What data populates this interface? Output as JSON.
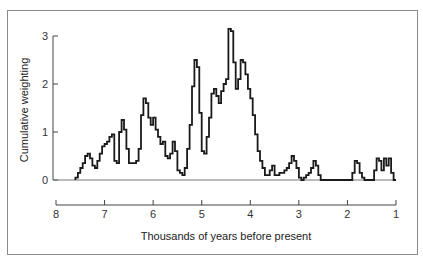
{
  "chart_data": {
    "type": "line",
    "style": "step",
    "title": "",
    "xlabel": "Thousands of years before present",
    "ylabel": "Cumulative weighting",
    "xlim": [
      8,
      1
    ],
    "ylim": [
      0,
      3
    ],
    "x_ticks": [
      "8",
      "7",
      "6",
      "5",
      "4",
      "3",
      "2",
      "1"
    ],
    "y_ticks": [
      "0",
      "1",
      "2",
      "3"
    ],
    "grid": false,
    "legend": null,
    "series": [
      {
        "name": "Cumulative weighting",
        "x": [
          7.6,
          7.55,
          7.5,
          7.45,
          7.4,
          7.35,
          7.3,
          7.25,
          7.2,
          7.15,
          7.1,
          7.05,
          7.0,
          6.95,
          6.9,
          6.85,
          6.8,
          6.75,
          6.7,
          6.65,
          6.6,
          6.55,
          6.5,
          6.45,
          6.4,
          6.35,
          6.3,
          6.25,
          6.2,
          6.15,
          6.1,
          6.05,
          6.0,
          5.95,
          5.9,
          5.85,
          5.8,
          5.75,
          5.7,
          5.65,
          5.6,
          5.55,
          5.5,
          5.45,
          5.4,
          5.35,
          5.3,
          5.25,
          5.2,
          5.15,
          5.1,
          5.05,
          5.0,
          4.95,
          4.9,
          4.85,
          4.8,
          4.75,
          4.7,
          4.65,
          4.6,
          4.55,
          4.5,
          4.45,
          4.4,
          4.35,
          4.3,
          4.25,
          4.2,
          4.15,
          4.1,
          4.05,
          4.0,
          3.95,
          3.9,
          3.85,
          3.8,
          3.75,
          3.7,
          3.65,
          3.6,
          3.55,
          3.5,
          3.45,
          3.4,
          3.35,
          3.3,
          3.25,
          3.2,
          3.15,
          3.1,
          3.05,
          3.0,
          2.95,
          2.9,
          2.85,
          2.8,
          2.75,
          2.7,
          2.65,
          2.6,
          1.9,
          1.85,
          1.8,
          1.75,
          1.7,
          1.65,
          1.6,
          1.45,
          1.4,
          1.35,
          1.3,
          1.25,
          1.2,
          1.15,
          1.1,
          1.05
        ],
        "values": [
          0.05,
          0.15,
          0.25,
          0.35,
          0.5,
          0.55,
          0.45,
          0.3,
          0.25,
          0.4,
          0.55,
          0.7,
          0.75,
          0.8,
          0.9,
          0.95,
          0.4,
          0.35,
          1.0,
          1.25,
          1.05,
          0.65,
          0.35,
          0.35,
          0.35,
          0.4,
          0.65,
          1.35,
          1.7,
          1.6,
          1.3,
          1.15,
          1.3,
          1.05,
          0.9,
          0.75,
          0.8,
          0.5,
          0.45,
          0.55,
          0.8,
          0.6,
          0.2,
          0.15,
          0.1,
          0.25,
          0.65,
          1.15,
          1.95,
          2.5,
          2.35,
          1.4,
          0.6,
          0.55,
          0.9,
          1.3,
          1.8,
          1.9,
          1.75,
          1.6,
          1.85,
          2.0,
          2.1,
          3.15,
          3.1,
          2.45,
          1.9,
          2.1,
          2.5,
          2.45,
          2.2,
          1.9,
          1.7,
          1.35,
          0.95,
          0.6,
          0.4,
          0.25,
          0.1,
          0.1,
          0.2,
          0.3,
          0.1,
          0.1,
          0.15,
          0.15,
          0.2,
          0.25,
          0.35,
          0.5,
          0.4,
          0.25,
          0.05,
          0.0,
          0.05,
          0.1,
          0.15,
          0.25,
          0.4,
          0.3,
          0.1,
          0.15,
          0.4,
          0.35,
          0.15,
          0.05,
          0.0,
          0.0,
          0.2,
          0.45,
          0.4,
          0.2,
          0.45,
          0.3,
          0.45,
          0.15,
          0.0
        ]
      }
    ]
  }
}
